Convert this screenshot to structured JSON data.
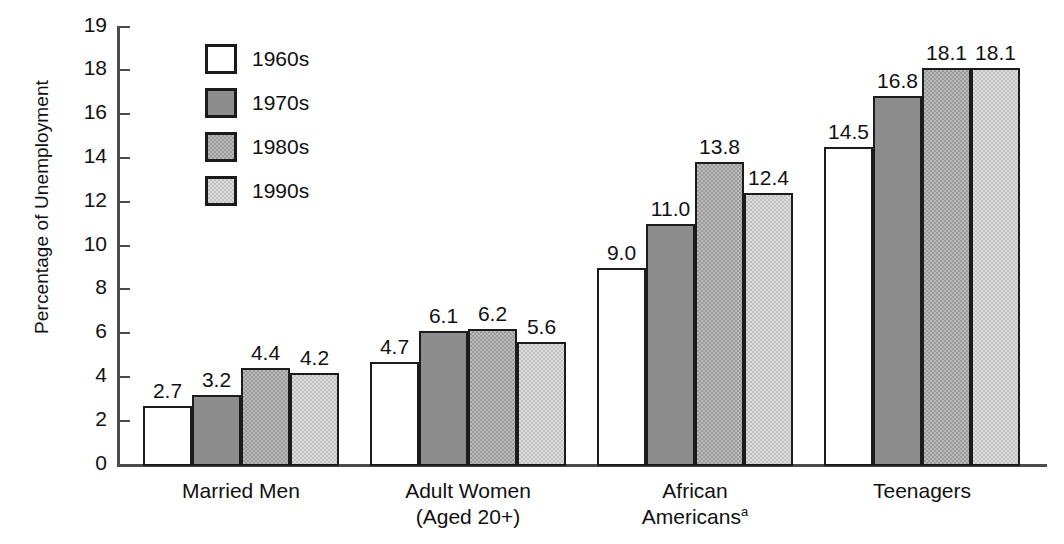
{
  "chart_data": {
    "type": "bar",
    "title": "",
    "xlabel": "",
    "ylabel": "Percentage of Unemployment",
    "ylim": [
      0,
      19
    ],
    "yticks": [
      0,
      2,
      4,
      6,
      8,
      10,
      12,
      14,
      16,
      18,
      19
    ],
    "ytick_labels": [
      "0",
      "2",
      "4",
      "6",
      "8",
      "10",
      "12",
      "14",
      "16",
      "18",
      "19"
    ],
    "grid": false,
    "legend_position": "upper-left-inside",
    "categories": [
      "Married Men",
      "Adult Women (Aged 20+)",
      "African Americans",
      "Teenagers"
    ],
    "series": [
      {
        "name": "1960s",
        "color": "#ffffff",
        "pattern": "solid-white",
        "values": [
          2.7,
          4.7,
          9.0,
          14.5
        ]
      },
      {
        "name": "1970s",
        "color": "#8d8d8d",
        "pattern": "solid-dark-gray",
        "values": [
          3.2,
          6.1,
          11.0,
          16.8
        ]
      },
      {
        "name": "1980s",
        "color": "#b9b9b9",
        "pattern": "checkerboard-medium-gray",
        "values": [
          4.4,
          6.2,
          13.8,
          18.1
        ]
      },
      {
        "name": "1990s",
        "color": "#dcdcdc",
        "pattern": "checkerboard-light-gray",
        "values": [
          4.2,
          5.6,
          12.4,
          18.1
        ]
      }
    ],
    "value_labels": [
      [
        "2.7",
        "3.2",
        "4.4",
        "4.2"
      ],
      [
        "4.7",
        "6.1",
        "6.2",
        "5.6"
      ],
      [
        "9.0",
        "11.0",
        "13.8",
        "12.4"
      ],
      [
        "14.5",
        "16.8",
        "18.1",
        "18.1"
      ]
    ]
  },
  "axis": {
    "y_title": "Percentage of Unemployment",
    "ticks": [
      "19",
      "18",
      "16",
      "14",
      "12",
      "10",
      "8",
      "6",
      "4",
      "2",
      "0"
    ]
  },
  "legend": {
    "items": [
      {
        "label": "1960s"
      },
      {
        "label": "1970s"
      },
      {
        "label": "1980s"
      },
      {
        "label": "1990s"
      }
    ]
  },
  "categories": [
    {
      "line1": "Married Men",
      "line2": "",
      "footnote": ""
    },
    {
      "line1": "Adult Women",
      "line2": "(Aged 20+)",
      "footnote": ""
    },
    {
      "line1": "African",
      "line2": "Americans",
      "footnote": "a"
    },
    {
      "line1": "Teenagers",
      "line2": "",
      "footnote": ""
    }
  ]
}
